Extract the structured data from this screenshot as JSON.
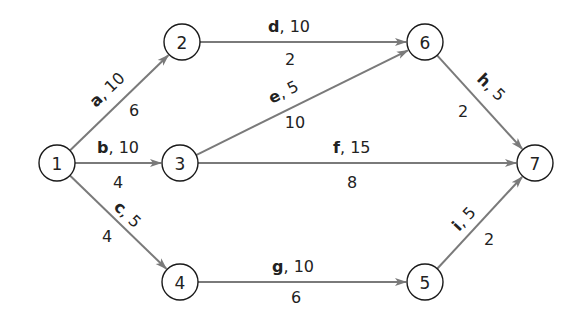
{
  "diagram": {
    "type": "activity-on-arrow network",
    "colors": {
      "edge": "#7a7a7a",
      "node_stroke": "#1a1a1a",
      "text": "#222222",
      "background": "#ffffff"
    },
    "nodes": [
      {
        "id": "1",
        "label": "1",
        "x": 57,
        "y": 163
      },
      {
        "id": "2",
        "label": "2",
        "x": 182,
        "y": 42
      },
      {
        "id": "3",
        "label": "3",
        "x": 180,
        "y": 163
      },
      {
        "id": "4",
        "label": "4",
        "x": 180,
        "y": 282
      },
      {
        "id": "5",
        "label": "5",
        "x": 425,
        "y": 282
      },
      {
        "id": "6",
        "label": "6",
        "x": 425,
        "y": 42
      },
      {
        "id": "7",
        "label": "7",
        "x": 535,
        "y": 163
      }
    ],
    "edges": [
      {
        "activity": "a",
        "from": "1",
        "to": "2",
        "value_top": "10",
        "value_bottom": "6",
        "top_label": {
          "x": 96,
          "y": 108,
          "rot": -44
        },
        "bottom_label": {
          "x": 134,
          "y": 116
        }
      },
      {
        "activity": "b",
        "from": "1",
        "to": "3",
        "value_top": "10",
        "value_bottom": "4",
        "top_label": {
          "x": 97,
          "y": 153,
          "rot": 0
        },
        "bottom_label": {
          "x": 118,
          "y": 188
        }
      },
      {
        "activity": "c",
        "from": "1",
        "to": "4",
        "value_top": "5",
        "value_bottom": "4",
        "top_label": {
          "x": 113,
          "y": 208,
          "rot": 44
        },
        "bottom_label": {
          "x": 107,
          "y": 242
        }
      },
      {
        "activity": "d",
        "from": "2",
        "to": "6",
        "value_top": "10",
        "value_bottom": "2",
        "top_label": {
          "x": 268,
          "y": 32,
          "rot": 0
        },
        "bottom_label": {
          "x": 290,
          "y": 65
        }
      },
      {
        "activity": "e",
        "from": "3",
        "to": "6",
        "value_top": "5",
        "value_bottom": "10",
        "top_label": {
          "x": 272,
          "y": 104,
          "rot": -27
        },
        "bottom_label": {
          "x": 295,
          "y": 128
        }
      },
      {
        "activity": "f",
        "from": "3",
        "to": "7",
        "value_top": "15",
        "value_bottom": "8",
        "top_label": {
          "x": 333,
          "y": 153,
          "rot": 0
        },
        "bottom_label": {
          "x": 352,
          "y": 188
        }
      },
      {
        "activity": "g",
        "from": "4",
        "to": "5",
        "value_top": "10",
        "value_bottom": "6",
        "top_label": {
          "x": 272,
          "y": 272,
          "rot": 0
        },
        "bottom_label": {
          "x": 296,
          "y": 303
        }
      },
      {
        "activity": "h",
        "from": "6",
        "to": "7",
        "value_top": "5",
        "value_bottom": "2",
        "top_label": {
          "x": 476,
          "y": 80,
          "rot": 44
        },
        "bottom_label": {
          "x": 463,
          "y": 117
        }
      },
      {
        "activity": "i",
        "from": "5",
        "to": "7",
        "value_top": "5",
        "value_bottom": "2",
        "top_label": {
          "x": 459,
          "y": 232,
          "rot": -47
        },
        "bottom_label": {
          "x": 489,
          "y": 245
        }
      }
    ]
  }
}
